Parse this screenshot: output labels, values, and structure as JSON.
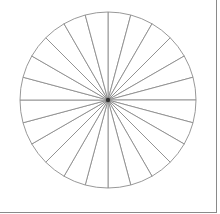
{
  "chart_data": {
    "type": "pie",
    "title": "",
    "categories": [
      "",
      "",
      "",
      "",
      "",
      "",
      "",
      "",
      "",
      "",
      "",
      "",
      "",
      "",
      "",
      "",
      "",
      "",
      "",
      "",
      "",
      "",
      "",
      ""
    ],
    "values": [
      1,
      1,
      1,
      1,
      1,
      1,
      1,
      1,
      1,
      1,
      1,
      1,
      1,
      1,
      1,
      1,
      1,
      1,
      1,
      1,
      1,
      1,
      1,
      1
    ],
    "slice_count": 24,
    "slice_angle_deg": 15,
    "start_angle_deg": 0,
    "legend": [],
    "labels_visible": false,
    "center": [
      108,
      100
    ],
    "radius": 88
  },
  "style": {
    "line_color": "#8c8c8c",
    "fill_color": "#ffffff",
    "frame_color": "#8a8a8a",
    "background": "#ffffff"
  }
}
